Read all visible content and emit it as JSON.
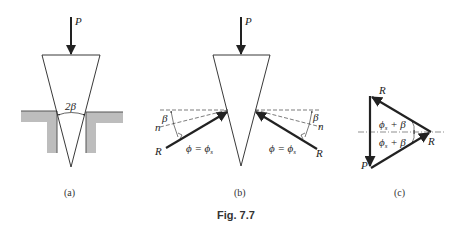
{
  "figure": {
    "caption": "Fig. 7.7",
    "panels": [
      {
        "id": "a",
        "label": "(a)",
        "load_label": "P",
        "angle_label": "2β",
        "description": "Wedge driven into a slot in shaded ground material"
      },
      {
        "id": "b",
        "label": "(b)",
        "load_label": "P",
        "left": {
          "reaction_label": "R",
          "normal_label": "n",
          "angle_beta": "β",
          "angle_phi": "ϕ = ϕ",
          "phi_sub": "s"
        },
        "right": {
          "reaction_label": "R",
          "normal_label": "n",
          "angle_beta": "β",
          "angle_phi": "ϕ = ϕ",
          "phi_sub": "s"
        }
      },
      {
        "id": "c",
        "label": "(c)",
        "description": "Force triangle",
        "vertex_labels": {
          "top": "R",
          "right": "R",
          "bottom": "P"
        },
        "angle_upper": "ϕ",
        "angle_upper_sub": "s",
        "angle_upper_rest": " + β",
        "angle_lower": "ϕ",
        "angle_lower_sub": "s",
        "angle_lower_rest": " + β"
      }
    ]
  },
  "colors": {
    "line": "#222222",
    "ground_fill": "#bdbdbd",
    "dash": "#444444"
  }
}
